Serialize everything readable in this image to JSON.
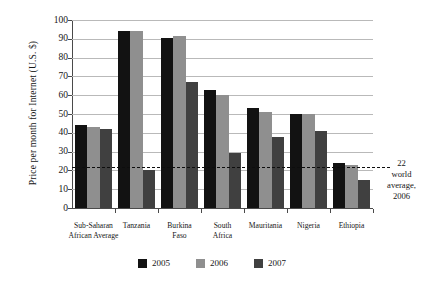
{
  "chart_data": {
    "type": "bar",
    "title": "",
    "subtitle": "",
    "xlabel": "",
    "ylabel": "Price per month for Internet (U.S. $)",
    "ylim": [
      0,
      100
    ],
    "ytick_step": 10,
    "grid": true,
    "legend_position": "bottom",
    "categories": [
      "Sub-Saharan African Average",
      "Tanzania",
      "Burkina Faso",
      "South Africa",
      "Mauritania",
      "Nigeria",
      "Ethiopia"
    ],
    "category_lines": [
      [
        "Sub-Saharan",
        "African Average"
      ],
      [
        "Tanzania"
      ],
      [
        "Burkina",
        "Faso"
      ],
      [
        "South",
        "Africa"
      ],
      [
        "Mauritania"
      ],
      [
        "Nigeria"
      ],
      [
        "Ethiopia"
      ]
    ],
    "yticks": [
      0,
      10,
      20,
      30,
      40,
      50,
      60,
      70,
      80,
      90,
      100
    ],
    "series": [
      {
        "name": "2005",
        "color": "#121212",
        "values": [
          44,
          94,
          90.5,
          63,
          53,
          50,
          24
        ]
      },
      {
        "name": "2006",
        "color": "#8f8f8f",
        "values": [
          43,
          94,
          91.5,
          60,
          51,
          50,
          23
        ]
      },
      {
        "name": "2007",
        "color": "#404040",
        "values": [
          42,
          20,
          67,
          29,
          38,
          41,
          15
        ]
      }
    ],
    "annotations": [
      {
        "name": "world-average-reference",
        "value": 22,
        "style": "dashed",
        "color": "#0d0d0d",
        "lines": [
          "22",
          "world",
          "average,",
          "2006"
        ]
      }
    ]
  },
  "legend": {
    "items": [
      {
        "label": "2005",
        "color": "#121212"
      },
      {
        "label": "2006",
        "color": "#8f8f8f"
      },
      {
        "label": "2007",
        "color": "#404040"
      }
    ]
  }
}
